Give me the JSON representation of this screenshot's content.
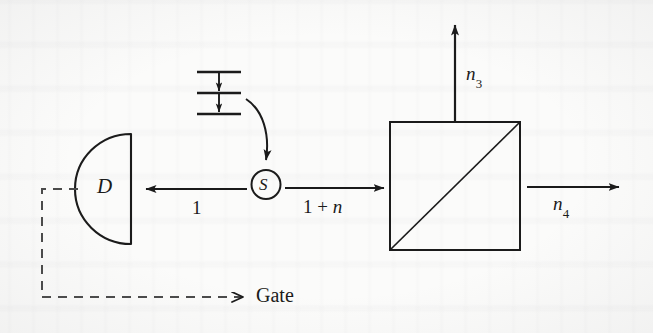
{
  "diagram": {
    "type": "optical-schematic",
    "nodes": {
      "detector": {
        "label": "D",
        "shape": "half-disc",
        "name": "detector"
      },
      "source": {
        "label": "S",
        "shape": "circle",
        "name": "source"
      },
      "beamsplitter": {
        "label": "",
        "shape": "square-with-diagonal",
        "name": "beam-splitter"
      },
      "energy_levels": {
        "name": "energy-level-cascade",
        "level_count": 3,
        "transition_count": 2
      }
    },
    "arrows": {
      "to_detector": {
        "label": "1",
        "direction": "left"
      },
      "to_beamsplitter": {
        "label_prefix": "1 + ",
        "label_italic": "n",
        "direction": "right"
      },
      "bs_output_up": {
        "label_italic": "n",
        "label_sub": "3",
        "direction": "up"
      },
      "bs_output_right": {
        "label_italic": "n",
        "label_sub": "4",
        "direction": "right"
      },
      "pump_curve": {
        "direction": "down-curved",
        "style": "solid"
      },
      "gate_feedback": {
        "label": "Gate",
        "style": "dashed",
        "direction": "right"
      }
    },
    "colors": {
      "ink": "#1b1b1b",
      "paper": "#fbfbfa"
    }
  }
}
